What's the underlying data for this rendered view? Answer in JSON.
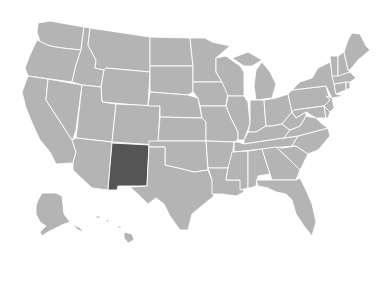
{
  "map": {
    "title": "United States",
    "colors": {
      "background": "#ffffff",
      "default_fill": "#b4b4b4",
      "highlight_fill": "#555555",
      "border": "#ffffff"
    },
    "highlighted_state": "New Mexico",
    "states": [
      {
        "id": "WA",
        "name": "Washington",
        "highlight": false,
        "d": "M38,23 L50,21 L84,27 L81,50 L62,48 L50,46 L40,42 L37,32 Z"
      },
      {
        "id": "OR",
        "name": "Oregon",
        "highlight": false,
        "d": "M37,40 L50,46 L62,48 L81,50 L76,65 L72,82 L28,76 L25,68 L30,55 Z"
      },
      {
        "id": "CA",
        "name": "California",
        "highlight": false,
        "d": "M28,76 L48,79 L46,100 L72,140 L76,152 L73,163 L56,164 L50,152 L40,140 L33,125 L26,108 L22,92 Z"
      },
      {
        "id": "NV",
        "name": "Nevada",
        "highlight": false,
        "d": "M48,79 L82,85 L76,130 L73,139 L72,140 L46,100 Z"
      },
      {
        "id": "ID",
        "name": "Idaho",
        "highlight": false,
        "d": "M84,27 L90,28 L88,45 L96,60 L95,68 L104,70 L101,87 L82,85 L72,82 L76,65 L81,50 Z"
      },
      {
        "id": "MT",
        "name": "Montana",
        "highlight": false,
        "d": "M90,28 L150,37 L150,72 L106,68 L104,70 L95,68 L96,60 L88,45 Z"
      },
      {
        "id": "WY",
        "name": "Wyoming",
        "highlight": false,
        "d": "M106,68 L150,72 L148,106 L102,102 L101,87 L104,70 Z"
      },
      {
        "id": "UT",
        "name": "Utah",
        "highlight": false,
        "d": "M82,85 L101,87 L102,102 L116,104 L112,142 L76,138 Z"
      },
      {
        "id": "AZ",
        "name": "Arizona",
        "highlight": false,
        "d": "M76,138 L112,142 L108,190 L92,188 L73,170 L73,163 L76,152 L72,140 Z"
      },
      {
        "id": "CO",
        "name": "Colorado",
        "highlight": false,
        "d": "M116,104 L160,106 L158,145 L112,142 Z"
      },
      {
        "id": "NM",
        "name": "New Mexico",
        "highlight": true,
        "d": "M112,143 L149,145 L147,186 L118,186 L117,190 L108,190 Z"
      },
      {
        "id": "ND",
        "name": "North Dakota",
        "highlight": false,
        "d": "M150,37 L190,38 L193,66 L150,66 Z"
      },
      {
        "id": "SD",
        "name": "South Dakota",
        "highlight": false,
        "d": "M150,66 L193,66 L193,92 L188,95 L150,92 Z"
      },
      {
        "id": "NE",
        "name": "Nebraska",
        "highlight": false,
        "d": "M150,92 L188,95 L198,98 L202,118 L160,117 L160,106 L148,106 Z"
      },
      {
        "id": "KS",
        "name": "Kansas",
        "highlight": false,
        "d": "M160,117 L202,118 L206,122 L206,141 L158,141 Z"
      },
      {
        "id": "OK",
        "name": "Oklahoma",
        "highlight": false,
        "d": "M149,141 L206,141 L208,170 L194,172 L178,168 L165,165 L165,147 L149,147 Z"
      },
      {
        "id": "TX",
        "name": "Texas",
        "highlight": false,
        "d": "M149,147 L165,147 L165,165 L178,168 L194,172 L208,170 L212,180 L214,196 L204,204 L192,214 L188,230 L180,230 L170,216 L164,204 L156,198 L148,204 L140,196 L130,187 L147,186 Z"
      },
      {
        "id": "MN",
        "name": "Minnesota",
        "highlight": false,
        "d": "M190,38 L205,38 L212,42 L230,46 L216,58 L216,72 L222,82 L193,82 L193,66 Z"
      },
      {
        "id": "IA",
        "name": "Iowa",
        "highlight": false,
        "d": "M193,82 L222,82 L228,92 L226,106 L200,106 L198,98 L193,92 Z"
      },
      {
        "id": "MO",
        "name": "Missouri",
        "highlight": false,
        "d": "M200,106 L226,106 L230,116 L238,132 L238,140 L234,142 L206,141 L206,122 L202,118 Z"
      },
      {
        "id": "AR",
        "name": "Arkansas",
        "highlight": false,
        "d": "M206,141 L234,142 L232,160 L228,168 L208,168 Z"
      },
      {
        "id": "LA",
        "name": "Louisiana",
        "highlight": false,
        "d": "M208,168 L228,168 L226,180 L240,180 L244,192 L236,196 L222,194 L212,194 L212,180 Z"
      },
      {
        "id": "WI",
        "name": "Wisconsin",
        "highlight": false,
        "d": "M216,58 L226,56 L240,66 L244,72 L244,86 L244,96 L228,96 L222,82 L216,72 Z"
      },
      {
        "id": "IL",
        "name": "Illinois",
        "highlight": false,
        "d": "M228,96 L244,96 L248,102 L250,124 L244,140 L238,140 L238,132 L230,116 L226,106 Z"
      },
      {
        "id": "MI",
        "name": "Michigan",
        "highlight": false,
        "d": "M232,58 L248,52 L262,60 L252,66 L244,66 Z M256,70 L262,62 L270,72 L276,84 L272,98 L256,100 L254,86 Z"
      },
      {
        "id": "IN",
        "name": "Indiana",
        "highlight": false,
        "d": "M250,100 L264,100 L266,126 L256,132 L248,132 L250,124 Z"
      },
      {
        "id": "OH",
        "name": "Ohio",
        "highlight": false,
        "d": "M264,100 L276,98 L288,94 L292,112 L282,124 L272,126 L266,126 Z"
      },
      {
        "id": "KY",
        "name": "Kentucky",
        "highlight": false,
        "d": "M244,140 L248,132 L256,132 L266,126 L272,126 L282,124 L290,130 L284,138 L244,144 Z"
      },
      {
        "id": "TN",
        "name": "Tennessee",
        "highlight": false,
        "d": "M238,142 L244,144 L284,138 L298,136 L292,146 L234,152 L234,142 Z"
      },
      {
        "id": "MS",
        "name": "Mississippi",
        "highlight": false,
        "d": "M232,152 L248,151 L248,188 L240,190 L240,180 L226,180 L228,168 Z"
      },
      {
        "id": "AL",
        "name": "Alabama",
        "highlight": false,
        "d": "M248,151 L262,149 L270,174 L258,176 L256,186 L250,188 L248,188 Z"
      },
      {
        "id": "GA",
        "name": "Georgia",
        "highlight": false,
        "d": "M262,149 L276,147 L290,160 L300,170 L296,180 L272,180 L270,174 Z"
      },
      {
        "id": "FL",
        "name": "Florida",
        "highlight": false,
        "d": "M256,180 L272,180 L296,180 L300,178 L306,190 L312,204 L316,222 L312,236 L304,226 L296,214 L292,200 L286,194 L276,192 L268,188 L258,186 Z"
      },
      {
        "id": "SC",
        "name": "South Carolina",
        "highlight": false,
        "d": "M282,148 L296,146 L308,154 L300,170 L290,160 L276,147 Z"
      },
      {
        "id": "NC",
        "name": "North Carolina",
        "highlight": false,
        "d": "M292,146 L298,136 L328,128 L330,136 L318,150 L308,154 L296,146 Z"
      },
      {
        "id": "VA",
        "name": "Virginia",
        "highlight": false,
        "d": "M284,138 L290,130 L300,126 L306,116 L316,118 L322,124 L328,128 L298,136 Z"
      },
      {
        "id": "WV",
        "name": "West Virginia",
        "highlight": false,
        "d": "M282,124 L292,112 L296,118 L306,112 L306,116 L300,126 L290,130 Z"
      },
      {
        "id": "PA",
        "name": "Pennsylvania",
        "highlight": false,
        "d": "M288,94 L292,90 L326,86 L330,100 L324,106 L294,110 L292,112 Z"
      },
      {
        "id": "NY",
        "name": "New York",
        "highlight": false,
        "d": "M292,90 L300,82 L312,78 L318,68 L330,62 L334,82 L336,94 L344,96 L332,98 L326,86 Z"
      },
      {
        "id": "MD",
        "name": "Maryland",
        "highlight": false,
        "d": "M294,110 L324,106 L326,118 L316,118 L306,112 L296,118 L292,112 Z"
      },
      {
        "id": "DE",
        "name": "Delaware",
        "highlight": false,
        "d": "M324,106 L330,112 L328,118 L326,118 Z"
      },
      {
        "id": "NJ",
        "name": "New Jersey",
        "highlight": false,
        "d": "M326,96 L332,98 L334,108 L330,112 L324,106 L330,100 Z"
      },
      {
        "id": "CT",
        "name": "Connecticut",
        "highlight": false,
        "d": "M334,84 L346,82 L346,90 L336,94 Z"
      },
      {
        "id": "RI",
        "name": "Rhode Island",
        "highlight": false,
        "d": "M346,82 L350,82 L350,88 L346,90 Z"
      },
      {
        "id": "MA",
        "name": "Massachusetts",
        "highlight": false,
        "d": "M332,76 L350,72 L356,78 L350,82 L346,82 L334,84 Z"
      },
      {
        "id": "VT",
        "name": "Vermont",
        "highlight": false,
        "d": "M330,56 L338,56 L338,76 L332,76 Z"
      },
      {
        "id": "NH",
        "name": "New Hampshire",
        "highlight": false,
        "d": "M338,56 L344,52 L348,70 L350,72 L338,76 Z"
      },
      {
        "id": "ME",
        "name": "Maine",
        "highlight": false,
        "d": "M344,52 L348,40 L352,33 L360,34 L366,46 L370,50 L358,60 L350,70 L348,70 Z"
      },
      {
        "id": "AK",
        "name": "Alaska",
        "highlight": false,
        "d": "M42,193 L56,193 L62,196 L64,214 L70,222 L64,224 L56,228 L48,232 L42,236 L40,232 L46,226 L40,222 L36,214 L36,206 L38,200 Z M72,224 L80,228 L84,232 L78,230 Z"
      },
      {
        "id": "HI",
        "name": "Hawaii",
        "highlight": false,
        "d": "M96,216 L100,216 L100,218 L96,218 Z M106,220 L109,220 L109,222 L106,222 Z M118,226 L121,226 L121,228 L118,228 Z M124,232 L132,234 L134,240 L128,243 L124,238 Z"
      }
    ]
  }
}
